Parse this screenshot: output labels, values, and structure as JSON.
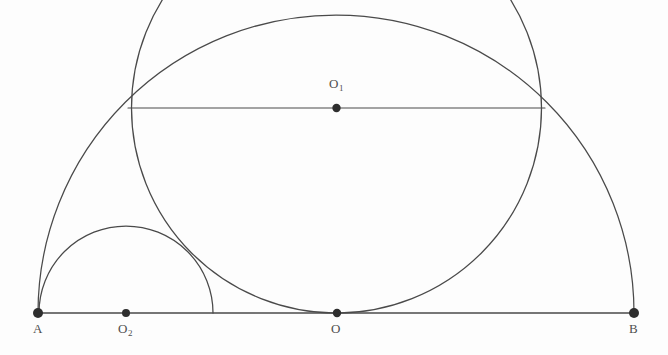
{
  "figure": {
    "kind": "geometry-diagram",
    "title": "",
    "background_color": "#fdfdfd",
    "stroke_color": "#4a4a4a",
    "label_color": "#4f4f4f",
    "width": 668,
    "height": 355
  },
  "labels": {
    "A": "A",
    "B": "B",
    "O": "O",
    "O1_base": "O",
    "O1_sub": "1",
    "O2_base": "O",
    "O2_sub": "2"
  },
  "points": [
    {
      "name": "A",
      "label": "A",
      "x": 38,
      "y": 313,
      "dot": true,
      "label_x": 33,
      "label_y": 321
    },
    {
      "name": "O2",
      "label": "O2",
      "x": 126,
      "y": 313,
      "dot": true,
      "label_x": 118,
      "label_y": 321
    },
    {
      "name": "O",
      "label": "O",
      "x": 337,
      "y": 313,
      "dot": true,
      "label_x": 331,
      "label_y": 321
    },
    {
      "name": "O1",
      "label": "O1",
      "x": 336.5,
      "y": 108,
      "dot": true,
      "label_x": 329,
      "label_y": 76
    },
    {
      "name": "B",
      "label": "B",
      "x": 634,
      "y": 313,
      "dot": true,
      "label_x": 629,
      "label_y": 321
    }
  ],
  "segments": [
    {
      "name": "baseline-AB",
      "x1": 38,
      "y1": 313,
      "x2": 634,
      "y2": 313
    },
    {
      "name": "chord-horizontal",
      "x1": 128,
      "y1": 108,
      "x2": 545,
      "y2": 108
    }
  ],
  "arcs": [
    {
      "name": "outer-semicircle-AB",
      "center_x": 336,
      "center_y": 313,
      "radius": 298,
      "start_deg": 180,
      "end_deg": 360,
      "description": "semicircle on diameter AB above the baseline"
    },
    {
      "name": "large-circle-O1",
      "center_x": 336.5,
      "center_y": 108,
      "radius": 205,
      "start_deg": 0,
      "end_deg": 360,
      "description": "circle centred at O1, tangent to AB at O, meeting the outer semicircle at the chord ends"
    },
    {
      "name": "small-semicircle-O2",
      "center_x": 126,
      "center_y": 313,
      "radius": 87,
      "start_deg": 180,
      "end_deg": 360,
      "description": "small semicircle from A, centred at O2, above the baseline"
    }
  ],
  "dot_radius": 4.5
}
